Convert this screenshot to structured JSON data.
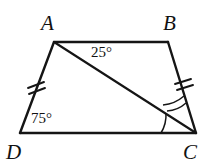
{
  "figure": {
    "kind": "plane-geometry-diagram",
    "shape": "trapezoid",
    "background_color": "#ffffff",
    "stroke_color": "#151515",
    "vertices": [
      {
        "name": "A",
        "label": "A",
        "x": 54,
        "y": 42,
        "label_x": 41,
        "label_y": 30
      },
      {
        "name": "B",
        "label": "B",
        "x": 168,
        "y": 42,
        "label_x": 163,
        "label_y": 30
      },
      {
        "name": "C",
        "label": "C",
        "x": 196,
        "y": 133,
        "label_x": 183,
        "label_y": 159
      },
      {
        "name": "D",
        "label": "D",
        "x": 20,
        "y": 133,
        "label_x": 6,
        "label_y": 159
      }
    ],
    "sides": [
      {
        "name": "side-AB",
        "from": "A",
        "to": "B",
        "ticks": 0
      },
      {
        "name": "side-BC",
        "from": "B",
        "to": "C",
        "ticks": 2
      },
      {
        "name": "side-CD",
        "from": "C",
        "to": "D",
        "ticks": 0
      },
      {
        "name": "side-DA",
        "from": "D",
        "to": "A",
        "ticks": 2
      }
    ],
    "diagonals": [
      {
        "name": "diagonal-AC",
        "from": "A",
        "to": "C"
      }
    ],
    "angle_labels": [
      {
        "name": "angle-BAC",
        "at_vertex": "A",
        "text": "25°",
        "x": 91,
        "y": 57
      },
      {
        "name": "angle-ADC",
        "at_vertex": "D",
        "text": "75°",
        "x": 31,
        "y": 123
      }
    ],
    "angle_marks": [
      {
        "name": "arc-ACD",
        "at_vertex": "C",
        "arcs": 1,
        "radius": 35
      },
      {
        "name": "arc-ACB",
        "at_vertex": "C",
        "arcs": 2,
        "radius": 30
      }
    ],
    "tick_marks": {
      "side_DA": {
        "count": 2,
        "center_x": 36,
        "center_y": 88
      },
      "side_BC": {
        "count": 2,
        "center_x": 183,
        "center_y": 88
      }
    }
  }
}
